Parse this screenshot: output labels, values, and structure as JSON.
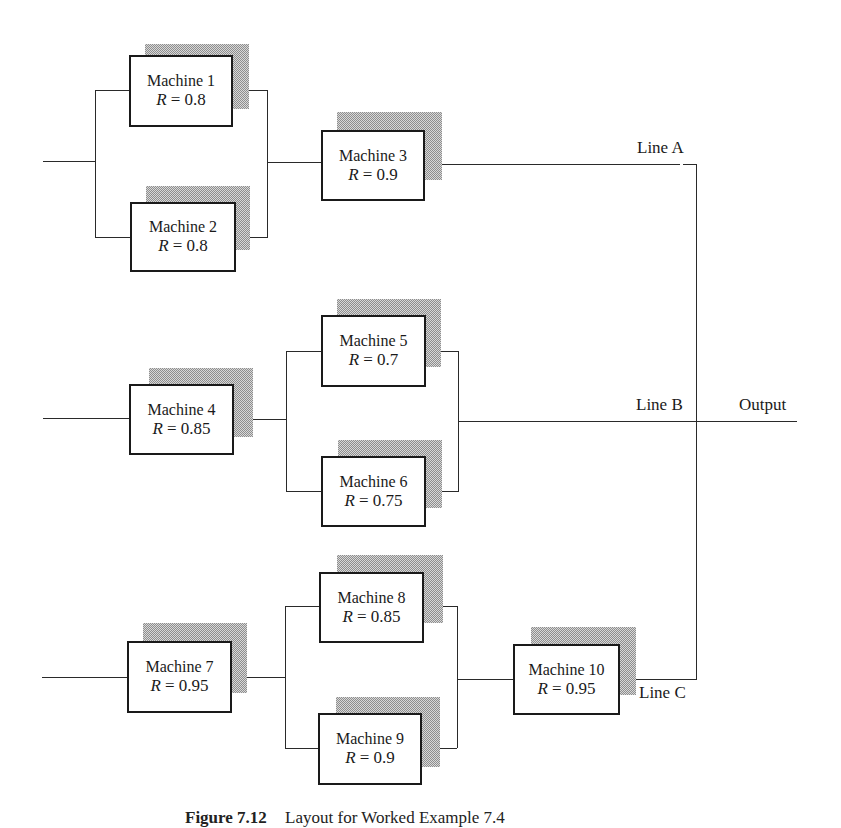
{
  "diagram": {
    "type": "reliability-block-diagram",
    "lines": [
      {
        "id": "A",
        "label": "Line A",
        "structure": "parallel(M1, M2) -> M3",
        "machines": [
          {
            "id": 1,
            "name": "Machine 1",
            "reliability": "R = 0.8"
          },
          {
            "id": 2,
            "name": "Machine 2",
            "reliability": "R = 0.8"
          },
          {
            "id": 3,
            "name": "Machine 3",
            "reliability": "R = 0.9"
          }
        ]
      },
      {
        "id": "B",
        "label": "Line B",
        "structure": "M4 -> parallel(M5, M6)",
        "machines": [
          {
            "id": 4,
            "name": "Machine 4",
            "reliability": "R = 0.85"
          },
          {
            "id": 5,
            "name": "Machine 5",
            "reliability": "R = 0.7"
          },
          {
            "id": 6,
            "name": "Machine 6",
            "reliability": "R = 0.75"
          }
        ]
      },
      {
        "id": "C",
        "label": "Line C",
        "structure": "M7 -> parallel(M8, M9) -> M10",
        "machines": [
          {
            "id": 7,
            "name": "Machine 7",
            "reliability": "R = 0.95"
          },
          {
            "id": 8,
            "name": "Machine 8",
            "reliability": "R = 0.85"
          },
          {
            "id": 9,
            "name": "Machine 9",
            "reliability": "R = 0.9"
          },
          {
            "id": 10,
            "name": "Machine 10",
            "reliability": "R = 0.95"
          }
        ]
      }
    ],
    "output_label": "Output",
    "caption": {
      "number": "Figure 7.12",
      "text": "Layout for Worked Example 7.4"
    }
  },
  "colors": {
    "line": "#2a2a2a",
    "box_border": "#1a1a1a",
    "shadow": "#b4b4b4",
    "background": "#ffffff"
  }
}
